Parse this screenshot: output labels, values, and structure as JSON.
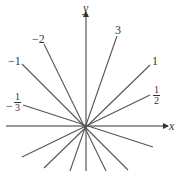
{
  "axes": {
    "x_label": "x",
    "y_label": "y"
  },
  "origin": [
    86,
    126
  ],
  "lines": [
    {
      "slope_label": "3",
      "end": [
        117,
        36
      ],
      "opposite": [
        70,
        171
      ]
    },
    {
      "slope_label": "-2",
      "end": [
        44,
        44
      ],
      "opposite": [
        106,
        171
      ]
    },
    {
      "slope_label": "-1",
      "end": [
        22,
        64
      ],
      "opposite": [
        128,
        170
      ]
    },
    {
      "slope_label": "-1/3",
      "end": [
        23,
        105
      ],
      "opposite": [
        153,
        147
      ]
    },
    {
      "slope_label": "1",
      "end": [
        150,
        65
      ],
      "opposite": [
        44,
        168
      ]
    },
    {
      "slope_label": "1/2",
      "end": [
        150,
        95
      ],
      "opposite": [
        22,
        157
      ]
    }
  ],
  "labels": {
    "three": "3",
    "neg_two": "−2",
    "neg_one": "−1",
    "neg_third": {
      "sign": "−",
      "num": "1",
      "den": "3"
    },
    "one": "1",
    "half": {
      "num": "1",
      "den": "2"
    }
  },
  "colors": {
    "line": "#555555",
    "axis": "#333333",
    "background": "#ffffff"
  }
}
